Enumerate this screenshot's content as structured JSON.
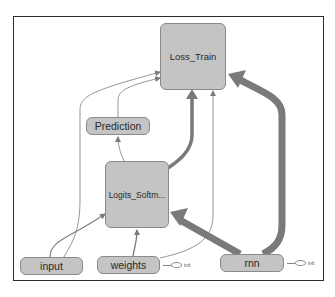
{
  "graph": {
    "nodes": {
      "loss_train": {
        "label": "Loss_Train"
      },
      "prediction": {
        "label": "Prediction"
      },
      "logits_softmax": {
        "label": "Logits_Softm..."
      },
      "input": {
        "label": "input"
      },
      "weights": {
        "label": "weights",
        "init_label": "init"
      },
      "rnn": {
        "label": "rnn",
        "init_label": "init"
      }
    },
    "edges": [
      {
        "from": "input",
        "to": "logits_softmax",
        "weight": "thin"
      },
      {
        "from": "input",
        "to": "loss_train",
        "weight": "thin"
      },
      {
        "from": "weights",
        "to": "logits_softmax",
        "weight": "thin"
      },
      {
        "from": "weights",
        "to": "loss_train",
        "weight": "thin"
      },
      {
        "from": "logits_softmax",
        "to": "prediction",
        "weight": "thin"
      },
      {
        "from": "prediction",
        "to": "loss_train",
        "weight": "thin"
      },
      {
        "from": "logits_softmax",
        "to": "loss_train",
        "weight": "medium"
      },
      {
        "from": "rnn",
        "to": "logits_softmax",
        "weight": "thick"
      },
      {
        "from": "rnn",
        "to": "loss_train",
        "weight": "thick"
      }
    ],
    "colors": {
      "node_fill": "#c4c4c4",
      "node_border": "#8a8a8a",
      "edge": "#7a7a7a",
      "frame": "#2b2b2b"
    }
  }
}
